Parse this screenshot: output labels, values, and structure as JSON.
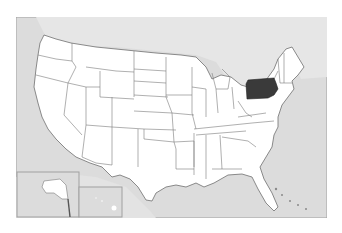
{
  "map": {
    "title": "United States locator map",
    "highlighted_state": "Pennsylvania",
    "colors": {
      "water": "#d9d9d9",
      "land": "#ffffff",
      "foreign_land": "#e4e4e4",
      "border": "#6e6e6e",
      "highlight": "#3a3a3a",
      "frame": "#a0a0a0"
    },
    "insets": [
      "Alaska",
      "Hawaii"
    ]
  }
}
